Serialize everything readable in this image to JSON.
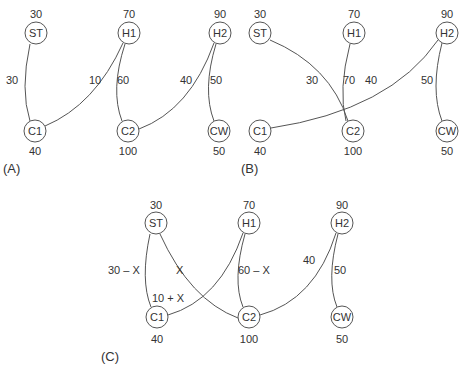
{
  "panels": [
    {
      "id": "A",
      "label": "(A)",
      "nodes": [
        {
          "name": "ST",
          "value": "30"
        },
        {
          "name": "H1",
          "value": "70"
        },
        {
          "name": "H2",
          "value": "90"
        },
        {
          "name": "C1",
          "value": "40"
        },
        {
          "name": "C2",
          "value": "100"
        },
        {
          "name": "CW",
          "value": "50"
        }
      ],
      "edges": [
        {
          "from": "ST",
          "to": "C1",
          "label": "30"
        },
        {
          "from": "H1",
          "to": "C1",
          "label": "10"
        },
        {
          "from": "H1",
          "to": "C2",
          "label": "60"
        },
        {
          "from": "H2",
          "to": "C2",
          "label": "40"
        },
        {
          "from": "H2",
          "to": "CW",
          "label": "50"
        }
      ]
    },
    {
      "id": "B",
      "label": "(B)",
      "nodes": [
        {
          "name": "ST",
          "value": "30"
        },
        {
          "name": "H1",
          "value": "70"
        },
        {
          "name": "H2",
          "value": "90"
        },
        {
          "name": "C1",
          "value": "40"
        },
        {
          "name": "C2",
          "value": "100"
        },
        {
          "name": "CW",
          "value": "50"
        }
      ],
      "edges": [
        {
          "from": "ST",
          "to": "C2",
          "label": "30"
        },
        {
          "from": "H1",
          "to": "C2",
          "label": "70"
        },
        {
          "from": "H2",
          "to": "C1",
          "label": "40"
        },
        {
          "from": "H2",
          "to": "CW",
          "label": "50"
        }
      ]
    },
    {
      "id": "C",
      "label": "(C)",
      "nodes": [
        {
          "name": "ST",
          "value": "30"
        },
        {
          "name": "H1",
          "value": "70"
        },
        {
          "name": "H2",
          "value": "90"
        },
        {
          "name": "C1",
          "value": "40"
        },
        {
          "name": "C2",
          "value": "100"
        },
        {
          "name": "CW",
          "value": "50"
        }
      ],
      "edges": [
        {
          "from": "ST",
          "to": "C1",
          "label": "30 – X"
        },
        {
          "from": "ST",
          "to": "C2",
          "label": "X"
        },
        {
          "from": "H1",
          "to": "C1",
          "label": "10 + X"
        },
        {
          "from": "H1",
          "to": "C2",
          "label": "60 – X"
        },
        {
          "from": "H2",
          "to": "C2",
          "label": "40"
        },
        {
          "from": "H2",
          "to": "CW",
          "label": "50"
        }
      ]
    }
  ]
}
